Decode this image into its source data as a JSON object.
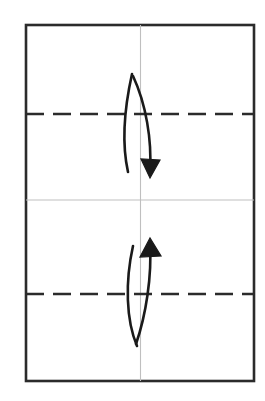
{
  "document": {
    "title": "Origami Fold Diagram",
    "kind": "origami-instruction-step",
    "canvas": {
      "width": 265,
      "height": 401,
      "background": "#ffffff"
    }
  },
  "colors": {
    "paper_edge": "#2b2b2b",
    "crease_existing": "#bfbfbf",
    "fold_line": "#2b2b2b",
    "arrow": "#1a1a1a",
    "paper_fill": "#ffffff"
  },
  "paper_sheet": {
    "label": "paper-sheet",
    "x": 26,
    "y": 25,
    "width": 228,
    "height": 356,
    "stroke_width": 2.6
  },
  "creases": [
    {
      "name": "vertical-center-crease",
      "orientation": "vertical",
      "style": "solid",
      "color": "#bfbfbf",
      "x1": 140.5,
      "y1": 25,
      "x2": 140.5,
      "y2": 381,
      "stroke_width": 1.1
    },
    {
      "name": "horizontal-center-crease",
      "orientation": "horizontal",
      "style": "solid",
      "color": "#bfbfbf",
      "x1": 26,
      "y1": 200,
      "x2": 254,
      "y2": 200,
      "stroke_width": 1.1
    }
  ],
  "fold_lines": [
    {
      "name": "upper-fold-line",
      "orientation": "horizontal",
      "style": "dashed",
      "meaning": "valley-fold",
      "color": "#2b2b2b",
      "x1": 26,
      "y1": 114,
      "x2": 254,
      "y2": 114,
      "stroke_width": 2.4,
      "dash": "18 9"
    },
    {
      "name": "lower-fold-line",
      "orientation": "horizontal",
      "style": "dashed",
      "meaning": "valley-fold",
      "color": "#2b2b2b",
      "x1": 26,
      "y1": 294,
      "x2": 254,
      "y2": 294,
      "stroke_width": 2.4,
      "dash": "18 9"
    }
  ],
  "arrows": [
    {
      "name": "upper-fold-arrow",
      "direction": "down",
      "meaning": "fold top edge down to center crease",
      "color": "#1a1a1a",
      "outer_path": "M 132 74 C 124 110, 122 145, 128 172",
      "inner_path": "M 133 76 C 146 104, 152 140, 150 171",
      "head_tip": {
        "x": 150,
        "y": 178
      },
      "head_left": {
        "x": 141,
        "y": 159
      },
      "head_right": {
        "x": 160,
        "y": 160
      },
      "stroke_width": 2.6
    },
    {
      "name": "lower-fold-arrow",
      "direction": "up",
      "meaning": "fold bottom edge up to center crease",
      "color": "#1a1a1a",
      "outer_path": "M 133 246 C 125 282, 126 320, 137 346",
      "inner_path": "M 150 243 C 152 276, 146 315, 136 344",
      "head_tip": {
        "x": 150,
        "y": 238
      },
      "head_left": {
        "x": 140,
        "y": 257
      },
      "head_right": {
        "x": 161,
        "y": 256
      },
      "stroke_width": 2.6
    }
  ],
  "legend": {
    "dashed_line_label": "valley fold",
    "gray_line_label": "existing crease",
    "arrow_label": "fold direction"
  }
}
